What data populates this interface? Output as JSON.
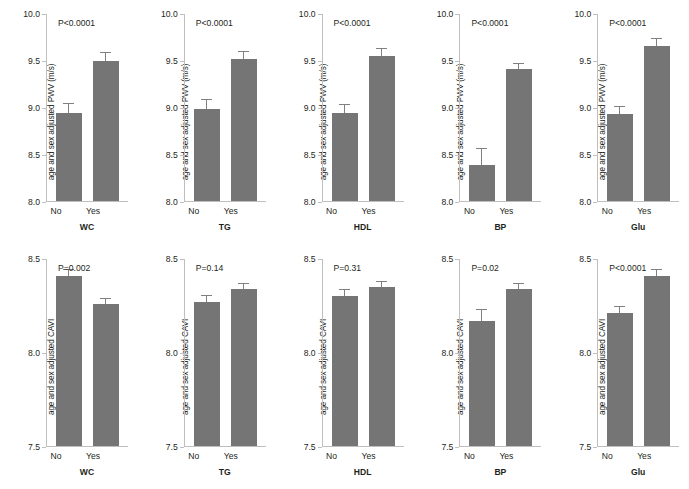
{
  "figure": {
    "bar_color": "#757575",
    "axis_color": "#bfbfbf",
    "text_color": "#231f20",
    "categories": [
      "No",
      "Yes"
    ],
    "rows": [
      {
        "id": "pwv",
        "ylabel": "age and sex adjusted PWV (m/s)",
        "ylim": [
          8.0,
          10.0
        ],
        "yticks": [
          "8.0",
          "8.5",
          "9.0",
          "9.5",
          "10.0"
        ],
        "ytick_values": [
          8.0,
          8.5,
          9.0,
          9.5,
          10.0
        ],
        "panels": [
          {
            "xtitle": "WC",
            "pvalue": "P<0.0001",
            "values": [
              8.94,
              9.5
            ],
            "errors": [
              0.1,
              0.08
            ]
          },
          {
            "xtitle": "TG",
            "pvalue": "P<0.0001",
            "values": [
              8.98,
              9.52
            ],
            "errors": [
              0.1,
              0.07
            ]
          },
          {
            "xtitle": "HDL",
            "pvalue": "P<0.0001",
            "values": [
              8.94,
              9.55
            ],
            "errors": [
              0.09,
              0.08
            ]
          },
          {
            "xtitle": "BP",
            "pvalue": "P<0.0001",
            "values": [
              8.39,
              9.41
            ],
            "errors": [
              0.17,
              0.06
            ]
          },
          {
            "xtitle": "Glu",
            "pvalue": "P<0.0001",
            "values": [
              8.93,
              9.66
            ],
            "errors": [
              0.08,
              0.07
            ]
          }
        ]
      },
      {
        "id": "cavi",
        "ylabel": "age and sex adjusted CAVI",
        "ylim": [
          7.5,
          8.5
        ],
        "yticks": [
          "7.5",
          "8.0",
          "8.5"
        ],
        "ytick_values": [
          7.5,
          8.0,
          8.5
        ],
        "panels": [
          {
            "xtitle": "WC",
            "pvalue": "P=0.002",
            "values": [
              8.41,
              8.26
            ],
            "errors": [
              0.03,
              0.028
            ]
          },
          {
            "xtitle": "TG",
            "pvalue": "P=0.14",
            "values": [
              8.27,
              8.34
            ],
            "errors": [
              0.032,
              0.028
            ]
          },
          {
            "xtitle": "HDL",
            "pvalue": "P=0.31",
            "values": [
              8.3,
              8.35
            ],
            "errors": [
              0.033,
              0.026
            ]
          },
          {
            "xtitle": "BP",
            "pvalue": "P=0.02",
            "values": [
              8.17,
              8.34
            ],
            "errors": [
              0.055,
              0.026
            ]
          },
          {
            "xtitle": "Glu",
            "pvalue": "P<0.0001",
            "values": [
              8.21,
              8.41
            ],
            "errors": [
              0.035,
              0.03
            ]
          }
        ]
      }
    ]
  },
  "chart_data": {
    "type": "bar",
    "title": "",
    "subtitle": "",
    "grid": false,
    "legend": "none",
    "xlabel": "Metabolic syndrome component present",
    "categories": [
      "No",
      "Yes"
    ],
    "panel_grid": {
      "rows": 2,
      "cols": 5
    },
    "charts": [
      {
        "panel": "WC (PWV)",
        "row": 1,
        "col": 1,
        "type": "bar",
        "ylabel": "age and sex adjusted PWV (m/s)",
        "xlabel": "WC",
        "ylim": [
          8.0,
          10.0
        ],
        "yticks": [
          8.0,
          8.5,
          9.0,
          9.5,
          10.0
        ],
        "categories": [
          "No",
          "Yes"
        ],
        "values": [
          8.94,
          9.5
        ],
        "errors": [
          0.1,
          0.08
        ],
        "annotation": "P<0.0001"
      },
      {
        "panel": "TG (PWV)",
        "row": 1,
        "col": 2,
        "type": "bar",
        "ylabel": "age and sex adjusted PWV (m/s)",
        "xlabel": "TG",
        "ylim": [
          8.0,
          10.0
        ],
        "yticks": [
          8.0,
          8.5,
          9.0,
          9.5,
          10.0
        ],
        "categories": [
          "No",
          "Yes"
        ],
        "values": [
          8.98,
          9.52
        ],
        "errors": [
          0.1,
          0.07
        ],
        "annotation": "P<0.0001"
      },
      {
        "panel": "HDL (PWV)",
        "row": 1,
        "col": 3,
        "type": "bar",
        "ylabel": "age and sex adjusted PWV (m/s)",
        "xlabel": "HDL",
        "ylim": [
          8.0,
          10.0
        ],
        "yticks": [
          8.0,
          8.5,
          9.0,
          9.5,
          10.0
        ],
        "categories": [
          "No",
          "Yes"
        ],
        "values": [
          8.94,
          9.55
        ],
        "errors": [
          0.09,
          0.08
        ],
        "annotation": "P<0.0001"
      },
      {
        "panel": "BP (PWV)",
        "row": 1,
        "col": 4,
        "type": "bar",
        "ylabel": "age and sex adjusted PWV (m/s)",
        "xlabel": "BP",
        "ylim": [
          8.0,
          10.0
        ],
        "yticks": [
          8.0,
          8.5,
          9.0,
          9.5,
          10.0
        ],
        "categories": [
          "No",
          "Yes"
        ],
        "values": [
          8.39,
          9.41
        ],
        "errors": [
          0.17,
          0.06
        ],
        "annotation": "P<0.0001"
      },
      {
        "panel": "Glu (PWV)",
        "row": 1,
        "col": 5,
        "type": "bar",
        "ylabel": "age and sex adjusted PWV (m/s)",
        "xlabel": "Glu",
        "ylim": [
          8.0,
          10.0
        ],
        "yticks": [
          8.0,
          8.5,
          9.0,
          9.5,
          10.0
        ],
        "categories": [
          "No",
          "Yes"
        ],
        "values": [
          8.93,
          9.66
        ],
        "errors": [
          0.08,
          0.07
        ],
        "annotation": "P<0.0001"
      },
      {
        "panel": "WC (CAVI)",
        "row": 2,
        "col": 1,
        "type": "bar",
        "ylabel": "age and sex adjusted CAVI",
        "xlabel": "WC",
        "ylim": [
          7.5,
          8.5
        ],
        "yticks": [
          7.5,
          8.0,
          8.5
        ],
        "categories": [
          "No",
          "Yes"
        ],
        "values": [
          8.41,
          8.26
        ],
        "errors": [
          0.03,
          0.028
        ],
        "annotation": "P=0.002"
      },
      {
        "panel": "TG (CAVI)",
        "row": 2,
        "col": 2,
        "type": "bar",
        "ylabel": "age and sex adjusted CAVI",
        "xlabel": "TG",
        "ylim": [
          7.5,
          8.5
        ],
        "yticks": [
          7.5,
          8.0,
          8.5
        ],
        "categories": [
          "No",
          "Yes"
        ],
        "values": [
          8.27,
          8.34
        ],
        "errors": [
          0.032,
          0.028
        ],
        "annotation": "P=0.14"
      },
      {
        "panel": "HDL (CAVI)",
        "row": 2,
        "col": 3,
        "type": "bar",
        "ylabel": "age and sex adjusted CAVI",
        "xlabel": "HDL",
        "ylim": [
          7.5,
          8.5
        ],
        "yticks": [
          7.5,
          8.0,
          8.5
        ],
        "categories": [
          "No",
          "Yes"
        ],
        "values": [
          8.3,
          8.35
        ],
        "errors": [
          0.033,
          0.026
        ],
        "annotation": "P=0.31"
      },
      {
        "panel": "BP (CAVI)",
        "row": 2,
        "col": 4,
        "type": "bar",
        "ylabel": "age and sex adjusted CAVI",
        "xlabel": "BP",
        "ylim": [
          7.5,
          8.5
        ],
        "yticks": [
          7.5,
          8.0,
          8.5
        ],
        "categories": [
          "No",
          "Yes"
        ],
        "values": [
          8.17,
          8.34
        ],
        "errors": [
          0.055,
          0.026
        ],
        "annotation": "P=0.02"
      },
      {
        "panel": "Glu (CAVI)",
        "row": 2,
        "col": 5,
        "type": "bar",
        "ylabel": "age and sex adjusted CAVI",
        "xlabel": "Glu",
        "ylim": [
          7.5,
          8.5
        ],
        "yticks": [
          7.5,
          8.0,
          8.5
        ],
        "categories": [
          "No",
          "Yes"
        ],
        "values": [
          8.21,
          8.41
        ],
        "errors": [
          0.035,
          0.03
        ],
        "annotation": "P<0.0001"
      }
    ]
  }
}
